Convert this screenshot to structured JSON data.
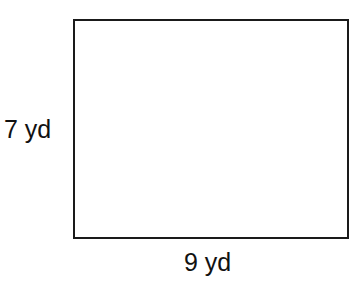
{
  "figure": {
    "shape": "rectangle",
    "height_label": "7 yd",
    "width_label": "9 yd",
    "stroke_color": "#1a1a1a",
    "fill_color": "#ffffff"
  }
}
